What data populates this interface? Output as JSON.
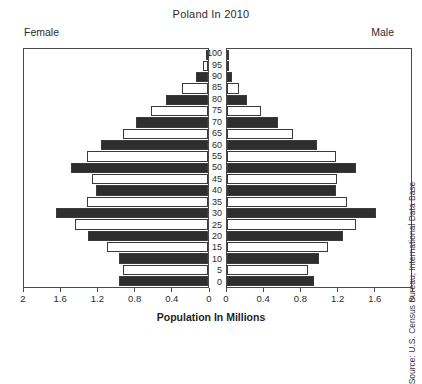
{
  "chart_data": {
    "type": "bar",
    "subtype": "population-pyramid",
    "title": "Poland In 2010",
    "xlabel": "Population In Millions",
    "ylabel": "",
    "left_panel_label": "Female",
    "right_panel_label": "Male",
    "source": "Source: U.S. Census Bureau, International Data Base",
    "grid": false,
    "legend": "none",
    "xlim_left": [
      2,
      0
    ],
    "xlim_right": [
      0,
      2
    ],
    "xticks_left": [
      "2",
      "1.6",
      "1.2",
      "0.8",
      "0.4",
      "0"
    ],
    "xticks_right": [
      "0",
      "0.4",
      "0.8",
      "1.2",
      "1.6",
      "2"
    ],
    "xtick_values_left": [
      2,
      1.6,
      1.2,
      0.8,
      0.4,
      0
    ],
    "xtick_values_right": [
      0,
      0.4,
      0.8,
      1.2,
      1.6,
      2
    ],
    "categories": [
      "100",
      "95",
      "90",
      "85",
      "80",
      "75",
      "70",
      "65",
      "60",
      "55",
      "50",
      "45",
      "40",
      "35",
      "30",
      "25",
      "20",
      "15",
      "10",
      "5",
      "0"
    ],
    "series": [
      {
        "name": "Female",
        "side": "left",
        "values": [
          0.01,
          0.05,
          0.13,
          0.28,
          0.46,
          0.62,
          0.78,
          0.92,
          1.16,
          1.32,
          1.49,
          1.26,
          1.22,
          1.32,
          1.65,
          1.45,
          1.3,
          1.1,
          0.97,
          0.92,
          0.97
        ]
      },
      {
        "name": "Male",
        "side": "right",
        "values": [
          0.005,
          0.02,
          0.05,
          0.13,
          0.22,
          0.37,
          0.55,
          0.72,
          0.98,
          1.18,
          1.4,
          1.2,
          1.18,
          1.3,
          1.62,
          1.4,
          1.26,
          1.1,
          1.0,
          0.88,
          0.95
        ]
      }
    ],
    "bar_fill_pattern": [
      "dark",
      "light",
      "dark",
      "light",
      "dark",
      "light",
      "dark",
      "light",
      "dark",
      "light",
      "dark",
      "light",
      "dark",
      "light",
      "dark",
      "light",
      "dark",
      "light",
      "dark",
      "light",
      "dark"
    ],
    "colors": {
      "bar_dark": "#2e2e2e",
      "bar_light": "#ffffff",
      "bar_outline": "#3a3a3a",
      "frame": "#4a4a4a",
      "text": "#2b2b2b",
      "background": "#ffffff"
    }
  }
}
